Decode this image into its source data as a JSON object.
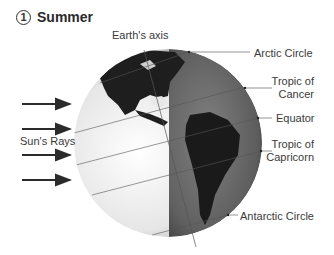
{
  "title": {
    "number": "1",
    "text": "Summer"
  },
  "labels": {
    "earth_axis": "Earth's axis",
    "arctic_circle": "Arctic Circle",
    "tropic_cancer_1": "Tropic of",
    "tropic_cancer_2": "Cancer",
    "equator": "Equator",
    "tropic_capricorn_1": "Tropic of",
    "tropic_capricorn_2": "Capricorn",
    "antarctic_circle": "Antarctic Circle",
    "suns_rays": "Sun's Rays"
  },
  "colors": {
    "lit": "#f2f2f2",
    "dark": "#5a5a5a",
    "land": "#1e1e1e",
    "arrow": "#2b2b2b"
  },
  "sun_rays_count": 4
}
